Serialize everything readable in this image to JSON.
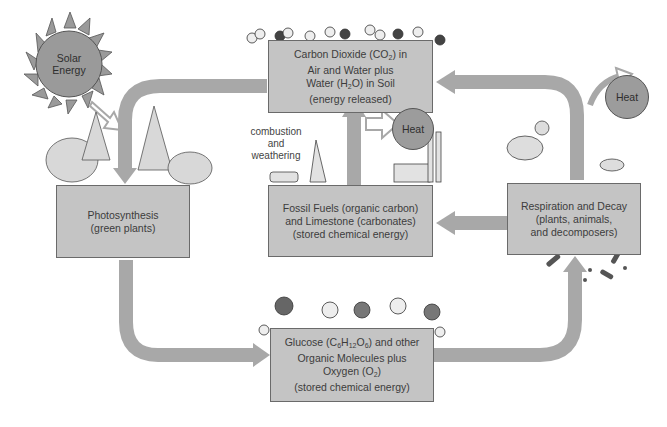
{
  "diagram": {
    "colors": {
      "box_fill": "#c4c4c4",
      "box_border": "#6a6a6a",
      "arrow": "#a8a8a8",
      "heat_circle": "#9c9c9c",
      "sun": "#9a9a9a",
      "background": "#ffffff"
    },
    "sun": {
      "label_line1": "Solar",
      "label_line2": "Energy"
    },
    "nodes": {
      "co2": {
        "line1_pre": "Carbon Dioxide (CO",
        "line1_sub": "2",
        "line1_post": ") in",
        "line2": "Air and Water plus",
        "line3_pre": "Water (H",
        "line3_sub": "2",
        "line3_post": "O) in Soil",
        "line4": "(energy released)"
      },
      "photosynthesis": {
        "line1": "Photosynthesis",
        "line2": "(green plants)"
      },
      "fossil": {
        "line1": "Fossil Fuels (organic carbon)",
        "line2": "and Limestone (carbonates)",
        "line3": "(stored chemical energy)"
      },
      "respiration": {
        "line1": "Respiration and Decay",
        "line2": "(plants, animals,",
        "line3": "and decomposers)"
      },
      "glucose": {
        "line1_a": "Glucose (C",
        "line1_sub1": "6",
        "line1_b": "H",
        "line1_sub2": "12",
        "line1_c": "O",
        "line1_sub3": "6",
        "line1_d": ") and  other",
        "line2": "Organic Molecules plus",
        "line3_pre": "Oxygen (O",
        "line3_sub": "2",
        "line3_post": ")",
        "line4": "(stored chemical energy)"
      }
    },
    "heat_labels": {
      "center": "Heat",
      "right": "Heat"
    },
    "annotations": {
      "combustion_line1": "combustion",
      "combustion_line2": "and",
      "combustion_line3": "weathering"
    },
    "edges": [
      {
        "from": "co2",
        "to": "photosynthesis"
      },
      {
        "from": "photosynthesis",
        "to": "glucose"
      },
      {
        "from": "glucose",
        "to": "respiration"
      },
      {
        "from": "respiration",
        "to": "co2"
      },
      {
        "from": "respiration",
        "to": "fossil"
      },
      {
        "from": "fossil",
        "to": "co2",
        "label": "combustion and weathering"
      },
      {
        "from": "sun",
        "to": "photosynthesis",
        "type": "energy"
      },
      {
        "from": "fossil",
        "to": "heat-center",
        "type": "energy"
      },
      {
        "from": "respiration",
        "to": "heat-right",
        "type": "energy"
      }
    ]
  }
}
